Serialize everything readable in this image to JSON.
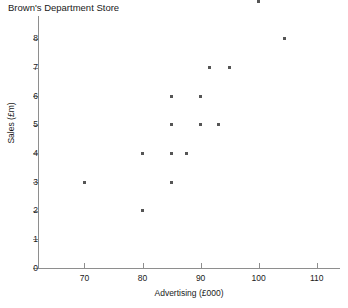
{
  "chart_data": {
    "type": "scatter",
    "title": "Brown's Department Store",
    "xlabel": "Advertising (£000)",
    "ylabel": "Sales (£m)",
    "xlim": [
      62,
      114
    ],
    "ylim": [
      0,
      8.8
    ],
    "grid": false,
    "legend": null,
    "xticks": [
      70,
      80,
      90,
      100,
      110
    ],
    "xtick_labels": [
      "70",
      "80",
      "90",
      "100",
      "110"
    ],
    "yticks": [
      0,
      1,
      2,
      3,
      4,
      5,
      6,
      7,
      8
    ],
    "ytick_labels": [
      "0",
      "1",
      "2",
      "3",
      "4",
      "5",
      "6",
      "7",
      "8"
    ],
    "marker": "square",
    "marker_color": "#555555",
    "axis_color": "#8e8e8e",
    "points": [
      {
        "x": 70,
        "y": 3
      },
      {
        "x": 80,
        "y": 2
      },
      {
        "x": 80,
        "y": 4
      },
      {
        "x": 85,
        "y": 3
      },
      {
        "x": 85,
        "y": 4
      },
      {
        "x": 85,
        "y": 5
      },
      {
        "x": 85,
        "y": 6
      },
      {
        "x": 87.5,
        "y": 4
      },
      {
        "x": 90,
        "y": 5
      },
      {
        "x": 90,
        "y": 6
      },
      {
        "x": 91.5,
        "y": 7
      },
      {
        "x": 93,
        "y": 5
      },
      {
        "x": 95,
        "y": 7
      },
      {
        "x": 100,
        "y": 9.3
      },
      {
        "x": 104.5,
        "y": 8
      }
    ]
  }
}
